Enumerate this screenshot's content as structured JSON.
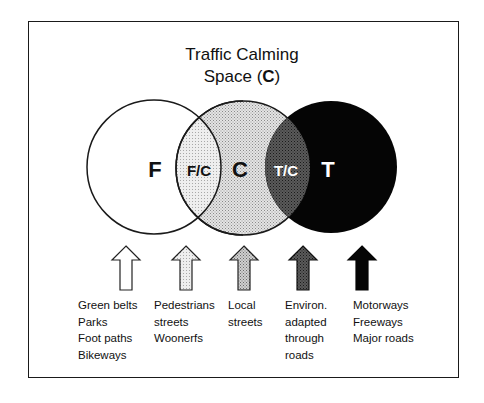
{
  "title": {
    "line1": "Traffic Calming",
    "line2_prefix": "Space (",
    "line2_bold": "C",
    "line2_suffix": ")"
  },
  "regions": {
    "F": "F",
    "FC": "F/C",
    "C": "C",
    "TC": "T/C",
    "T": "T"
  },
  "colors": {
    "frame": "#1a1a1a",
    "F_fill": "#ffffff",
    "C_fill": "#dcdcdc",
    "TC_fill": "#4a4a4a",
    "T_fill": "#050505",
    "FC_fill": "#ececec"
  },
  "arrows": [
    {
      "id": "arrow-f",
      "style": "white"
    },
    {
      "id": "arrow-fc",
      "style": "light-dotted"
    },
    {
      "id": "arrow-c",
      "style": "medium-dotted"
    },
    {
      "id": "arrow-tc",
      "style": "dark-dotted"
    },
    {
      "id": "arrow-t",
      "style": "black"
    }
  ],
  "columns": [
    {
      "lines": [
        "Green belts",
        "Parks",
        "Foot paths",
        "Bikeways"
      ]
    },
    {
      "lines": [
        "Pedestrians",
        "streets",
        "Woonerfs"
      ]
    },
    {
      "lines": [
        "Local",
        "streets"
      ]
    },
    {
      "lines": [
        "Environ.",
        "adapted",
        "through",
        "roads"
      ]
    },
    {
      "lines": [
        "Motorways",
        "Freeways",
        "Major roads"
      ]
    }
  ]
}
